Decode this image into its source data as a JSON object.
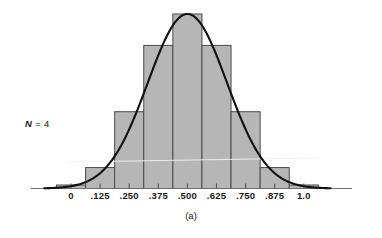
{
  "figure": {
    "caption": "(a)",
    "annotation_prefix": "N",
    "annotation_text": " = 4",
    "annotation_full": "N = 4"
  },
  "chart_data": {
    "type": "bar",
    "title": "",
    "subtitle": "",
    "xlabel": "",
    "ylabel": "",
    "categories": [
      "0",
      ".125",
      ".250",
      ".375",
      ".500",
      ".625",
      ".750",
      ".875",
      "1.0"
    ],
    "tick_labels": [
      "0",
      ".125",
      ".250",
      ".375",
      ".500",
      ".625",
      ".750",
      ".875",
      "1.0"
    ],
    "values": [
      1,
      6,
      22,
      41,
      50,
      41,
      22,
      6,
      1
    ],
    "bar_relative_heights": [
      0.02,
      0.12,
      0.44,
      0.82,
      1.0,
      0.82,
      0.44,
      0.12,
      0.02
    ],
    "xlim": [
      -0.0625,
      1.0625
    ],
    "ylim": [
      0,
      50
    ],
    "grid": false,
    "legend": null,
    "annotations": [
      "N = 4",
      "(a)"
    ],
    "overlay_curve": {
      "type": "normal",
      "mean": 0.5,
      "sd": 0.17,
      "color": "#111111",
      "label": "normal approximation curve"
    },
    "bar_fill": "#b6b6b6",
    "bar_stroke": "#4a4a4a",
    "axis_color": "#6f6f6f"
  }
}
